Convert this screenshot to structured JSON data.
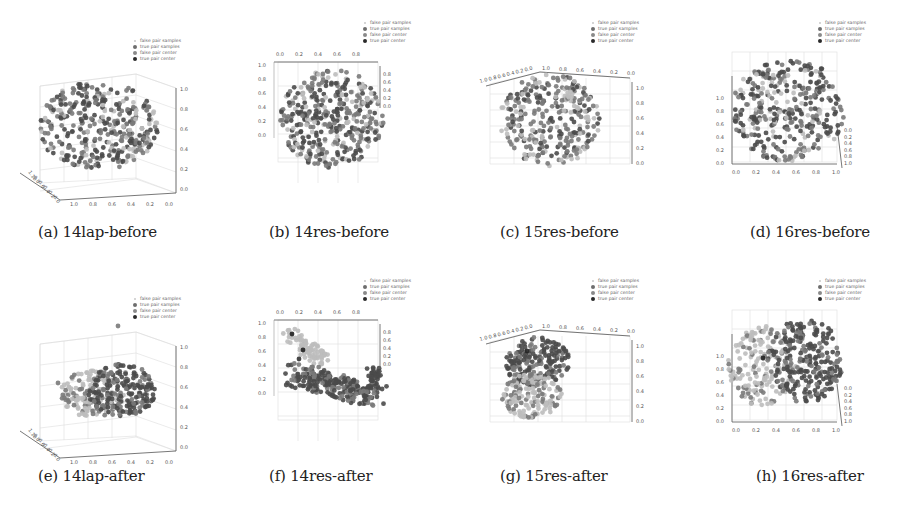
{
  "figure": {
    "legend_entries": [
      "false pair samples",
      "true pair samples",
      "false pair center",
      "true pair center"
    ],
    "legend_colors": [
      "#c8c8c8",
      "#6e6e6e",
      "#8a8a8a",
      "#2a2a2a"
    ],
    "panels": [
      {
        "id": "a",
        "caption": "(a) 14lap-before",
        "view": "lap",
        "row": 0,
        "col": 0
      },
      {
        "id": "b",
        "caption": "(b) 14res-before",
        "view": "res14",
        "row": 0,
        "col": 1
      },
      {
        "id": "c",
        "caption": "(c) 15res-before",
        "view": "res15",
        "row": 0,
        "col": 2
      },
      {
        "id": "d",
        "caption": "(d) 16res-before",
        "view": "res16",
        "row": 0,
        "col": 3
      },
      {
        "id": "e",
        "caption": "(e) 14lap-after",
        "view": "lap",
        "row": 1,
        "col": 0
      },
      {
        "id": "f",
        "caption": "(f) 14res-after",
        "view": "res14",
        "row": 1,
        "col": 1
      },
      {
        "id": "g",
        "caption": "(g) 15res-after",
        "view": "res15",
        "row": 1,
        "col": 2
      },
      {
        "id": "h",
        "caption": "(h) 16res-after",
        "view": "res16",
        "row": 1,
        "col": 3
      }
    ]
  },
  "chart_data": [
    {
      "type": "scatter",
      "title": "(a) 14lap-before",
      "subtype": "3d",
      "legend": [
        "false pair samples",
        "true pair samples",
        "false pair center",
        "true pair center"
      ],
      "legend_position": "upper right",
      "axes": {
        "z_ticks": [
          "0.0",
          "0.2",
          "0.4",
          "0.6",
          "0.8",
          "1.0"
        ],
        "x_ticks": [
          "1.0",
          "0.8",
          "0.6",
          "0.4",
          "0.2",
          "0.0"
        ],
        "y_ticks": [
          "1.0",
          "0.8",
          "0.6",
          "0.4",
          "0.2",
          "0.0"
        ]
      },
      "ranges": {
        "x": [
          0,
          1
        ],
        "y": [
          0,
          1
        ],
        "z": [
          0,
          1
        ]
      },
      "description": "Spherical cloud centered near (0.5,0.5,0.5); true and false samples fully intermixed",
      "clusters": [
        {
          "name": "true pair samples",
          "center": [
            0.5,
            0.5,
            0.5
          ],
          "radius": 0.4
        },
        {
          "name": "false pair samples",
          "center": [
            0.5,
            0.5,
            0.5
          ],
          "radius": 0.4
        }
      ]
    },
    {
      "type": "scatter",
      "title": "(b) 14res-before",
      "subtype": "3d",
      "legend": [
        "false pair samples",
        "true pair samples",
        "false pair center",
        "true pair center"
      ],
      "axes": {
        "top_ticks": [
          "0.0",
          "0.2",
          "0.4",
          "0.6",
          "0.8"
        ],
        "left_ticks": [
          "0.0",
          "0.2",
          "0.4",
          "0.6",
          "0.8",
          "1.0"
        ],
        "right_ticks": [
          "0.0",
          "0.2",
          "0.4",
          "0.6",
          "0.8"
        ]
      },
      "ranges": {
        "x": [
          0,
          1
        ],
        "y": [
          0,
          1
        ],
        "z": [
          0,
          1
        ]
      },
      "description": "Spherical cloud, true and false samples intermixed",
      "clusters": [
        {
          "name": "true pair samples",
          "center": [
            0.5,
            0.5,
            0.5
          ],
          "radius": 0.4
        },
        {
          "name": "false pair samples",
          "center": [
            0.5,
            0.5,
            0.5
          ],
          "radius": 0.4
        }
      ]
    },
    {
      "type": "scatter",
      "title": "(c) 15res-before",
      "subtype": "3d",
      "legend": [
        "false pair samples",
        "true pair samples",
        "false pair center",
        "true pair center"
      ],
      "axes": {
        "top_left_ticks": [
          "1.0",
          "0.8",
          "0.6",
          "0.4",
          "0.2",
          "0.0"
        ],
        "top_ticks": [
          "1.0",
          "0.8",
          "0.6",
          "0.4",
          "0.2",
          "0.0"
        ],
        "right_ticks": [
          "0.0",
          "0.2",
          "0.4",
          "0.6",
          "0.8",
          "1.0"
        ]
      },
      "ranges": {
        "x": [
          0,
          1
        ],
        "y": [
          0,
          1
        ],
        "z": [
          0,
          1
        ]
      },
      "description": "Spherical cloud, samples intermixed",
      "clusters": [
        {
          "name": "true pair samples",
          "center": [
            0.5,
            0.5,
            0.5
          ],
          "radius": 0.4
        },
        {
          "name": "false pair samples",
          "center": [
            0.5,
            0.5,
            0.5
          ],
          "radius": 0.4
        }
      ]
    },
    {
      "type": "scatter",
      "title": "(d) 16res-before",
      "subtype": "3d",
      "legend": [
        "false pair samples",
        "true pair samples",
        "false pair center",
        "true pair center"
      ],
      "axes": {
        "left_ticks": [
          "0.0",
          "0.2",
          "0.4",
          "0.6",
          "0.8",
          "1.0"
        ],
        "bottom_ticks": [
          "0.0",
          "0.2",
          "0.4",
          "0.6",
          "0.8",
          "1.0"
        ],
        "right_ticks": [
          "0.0",
          "0.2",
          "0.4",
          "0.6",
          "0.8",
          "1.0"
        ]
      },
      "ranges": {
        "x": [
          0,
          1
        ],
        "y": [
          0,
          1
        ],
        "z": [
          0,
          1
        ]
      },
      "description": "Spherical cloud, samples intermixed",
      "clusters": [
        {
          "name": "true pair samples",
          "center": [
            0.5,
            0.5,
            0.5
          ],
          "radius": 0.4
        },
        {
          "name": "false pair samples",
          "center": [
            0.5,
            0.5,
            0.5
          ],
          "radius": 0.4
        }
      ]
    },
    {
      "type": "scatter",
      "title": "(e) 14lap-after",
      "subtype": "3d",
      "legend": [
        "false pair samples",
        "true pair samples",
        "false pair center",
        "true pair center"
      ],
      "axes": {
        "z_ticks": [
          "0.0",
          "0.2",
          "0.4",
          "0.6",
          "0.8",
          "1.0"
        ],
        "x_ticks": [
          "1.0",
          "0.8",
          "0.6",
          "0.4",
          "0.2",
          "0.0"
        ]
      },
      "ranges": {
        "x": [
          0,
          1
        ],
        "y": [
          0,
          1
        ],
        "z": [
          0,
          1
        ]
      },
      "description": "Compact cloud; false samples lighter on left side, true samples darker on right; two outlier points",
      "clusters": [
        {
          "name": "false pair samples",
          "center": [
            0.55,
            0.5,
            0.4
          ],
          "radius": 0.25
        },
        {
          "name": "true pair samples",
          "center": [
            0.4,
            0.5,
            0.4
          ],
          "radius": 0.25
        }
      ]
    },
    {
      "type": "scatter",
      "title": "(f) 14res-after",
      "subtype": "3d",
      "legend": [
        "false pair samples",
        "true pair samples",
        "false pair center",
        "true pair center"
      ],
      "axes": {
        "top_ticks": [
          "0.0",
          "0.2",
          "0.4",
          "0.6",
          "0.8"
        ],
        "left_ticks": [
          "0.0",
          "0.2",
          "0.4",
          "0.6",
          "0.8",
          "1.0"
        ],
        "right_ticks": [
          "0.0",
          "0.2",
          "0.4",
          "0.6",
          "0.8"
        ]
      },
      "ranges": {
        "x": [
          0,
          1
        ],
        "y": [
          0,
          1
        ],
        "z": [
          0,
          1
        ]
      },
      "description": "Elongated diagonal band; light false-pair cluster upper left, dark true-pair samples along lower diagonal",
      "clusters": [
        {
          "name": "false pair samples",
          "center": [
            0.15,
            0.5,
            0.5
          ],
          "radius": 0.15
        },
        {
          "name": "true pair samples",
          "center": [
            0.55,
            0.5,
            0.1
          ],
          "radius": 0.3
        }
      ]
    },
    {
      "type": "scatter",
      "title": "(g) 15res-after",
      "subtype": "3d",
      "legend": [
        "false pair samples",
        "true pair samples",
        "false pair center",
        "true pair center"
      ],
      "axes": {
        "top_left_ticks": [
          "1.0",
          "0.8",
          "0.6",
          "0.4",
          "0.2",
          "0.0"
        ],
        "top_ticks": [
          "1.0",
          "0.8",
          "0.6",
          "0.4",
          "0.2",
          "0.0"
        ],
        "right_ticks": [
          "0.0",
          "0.2",
          "0.4",
          "0.6",
          "0.8",
          "1.0"
        ]
      },
      "ranges": {
        "x": [
          0,
          1
        ],
        "y": [
          0,
          1
        ],
        "z": [
          0,
          1
        ]
      },
      "description": "Compact sphere on left; true (dark) on top, false (light) on bottom",
      "clusters": [
        {
          "name": "true pair samples",
          "center": [
            0.8,
            0.5,
            0.6
          ],
          "radius": 0.2
        },
        {
          "name": "false pair samples",
          "center": [
            0.8,
            0.5,
            0.3
          ],
          "radius": 0.2
        }
      ]
    },
    {
      "type": "scatter",
      "title": "(h) 16res-after",
      "subtype": "3d",
      "legend": [
        "false pair samples",
        "true pair samples",
        "false pair center",
        "true pair center"
      ],
      "axes": {
        "left_ticks": [
          "0.0",
          "0.2",
          "0.4",
          "0.6",
          "0.8",
          "1.0"
        ],
        "bottom_ticks": [
          "0.0",
          "0.2",
          "0.4",
          "0.6",
          "0.8",
          "1.0"
        ],
        "right_ticks": [
          "0.0",
          "0.2",
          "0.4",
          "0.6",
          "0.8",
          "1.0"
        ]
      },
      "ranges": {
        "x": [
          0,
          1
        ],
        "y": [
          0,
          1
        ],
        "z": [
          0,
          1
        ]
      },
      "description": "False samples (light) on left, true samples (dark) on right",
      "clusters": [
        {
          "name": "false pair samples",
          "center": [
            0.3,
            0.5,
            0.6
          ],
          "radius": 0.25
        },
        {
          "name": "true pair samples",
          "center": [
            0.65,
            0.5,
            0.65
          ],
          "radius": 0.25
        }
      ]
    }
  ]
}
